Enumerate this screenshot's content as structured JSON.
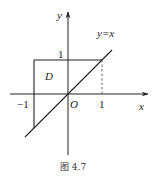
{
  "diagram": {
    "axes": {
      "x_label": "x",
      "y_label": "y",
      "origin_label": "O"
    },
    "ticks": {
      "x_neg_one": "−1",
      "x_one": "1",
      "y_one": "1"
    },
    "region_label": "D",
    "line_label": "y=x",
    "caption": "图 4.7",
    "elements": [
      {
        "type": "line",
        "name": "y=x",
        "from": [
          -1.25,
          -1.25
        ],
        "to": [
          1.3,
          1.3
        ]
      },
      {
        "type": "segment",
        "name": "top-edge",
        "from": [
          -1,
          1
        ],
        "to": [
          1,
          1
        ]
      },
      {
        "type": "segment",
        "name": "left-edge",
        "from": [
          -1,
          1
        ],
        "to": [
          -1,
          -1
        ]
      },
      {
        "type": "dashed-segment",
        "name": "x=1 guide",
        "from": [
          1,
          0
        ],
        "to": [
          1,
          1
        ]
      }
    ],
    "colors": {
      "stroke": "#222222",
      "background": "#ffffff"
    }
  }
}
